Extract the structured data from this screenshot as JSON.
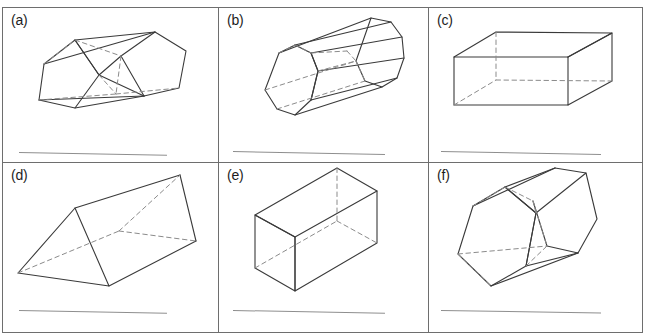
{
  "worksheet": {
    "top_clipped_text": "",
    "panels": [
      {
        "id": "a",
        "label": "(a)",
        "shape_name": "pentagonal-prism",
        "answer_line": true
      },
      {
        "id": "b",
        "label": "(b)",
        "shape_name": "octagonal-prism",
        "answer_line": true
      },
      {
        "id": "c",
        "label": "(c)",
        "shape_name": "rectangular-prism",
        "answer_line": true
      },
      {
        "id": "d",
        "label": "(d)",
        "shape_name": "triangular-prism",
        "answer_line": true
      },
      {
        "id": "e",
        "label": "(e)",
        "shape_name": "rectangular-prism-isometric",
        "answer_line": true
      },
      {
        "id": "f",
        "label": "(f)",
        "shape_name": "hexagonal-prism",
        "answer_line": true
      }
    ]
  },
  "colors": {
    "border": "#6e6e6e",
    "solid_edge": "#3a3a3a",
    "hidden_edge": "#8b8b8b",
    "answer_rule": "#8e8e8e",
    "label_text": "#1d1d1d",
    "background": "#ffffff"
  }
}
